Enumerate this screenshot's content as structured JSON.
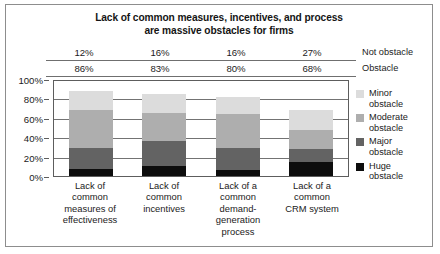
{
  "chart_data": {
    "type": "bar",
    "subtype": "stacked-bar-100",
    "title": "Lack of common measures, incentives, and process are massive obstacles for firms",
    "title_line1": "Lack of common measures, incentives, and process",
    "title_line2": "are massive obstacles for firms",
    "xlabel": "",
    "ylabel": "",
    "ylim": [
      0,
      100
    ],
    "ytick_labels": [
      "100%",
      "80%",
      "60%",
      "40%",
      "20%",
      "0%"
    ],
    "ytick_values": [
      100,
      80,
      60,
      40,
      20,
      0
    ],
    "grid": true,
    "legend_position": "right",
    "categories": [
      "Lack of common measures of effectiveness",
      "Lack of common incentives",
      "Lack of a common demand-generation process",
      "Lack of a common CRM system"
    ],
    "category_lines": [
      [
        "Lack of",
        "common",
        "measures of",
        "effectiveness"
      ],
      [
        "Lack of",
        "common",
        "incentives"
      ],
      [
        "Lack of a",
        "common",
        "demand-",
        "generation",
        "process"
      ],
      [
        "Lack of a",
        "common",
        "CRM system"
      ]
    ],
    "series": [
      {
        "name": "Huge obstacle",
        "color": "#0d0d0d",
        "values": [
          7,
          10,
          6,
          14
        ]
      },
      {
        "name": "Major obstacle",
        "color": "#636363",
        "values": [
          22,
          26,
          23,
          14
        ]
      },
      {
        "name": "Moderate obstacle",
        "color": "#aeaeae",
        "values": [
          39,
          29,
          35,
          19
        ]
      },
      {
        "name": "Minor obstacle",
        "color": "#dcdcdc",
        "values": [
          20,
          20,
          17,
          21
        ]
      }
    ],
    "bar_totals": [
      88,
      85,
      81,
      68
    ],
    "annotations": {
      "row_labels": [
        "Not obstacle",
        "Obstacle"
      ],
      "not_obstacle": [
        "12%",
        "16%",
        "16%",
        "27%"
      ],
      "obstacle": [
        "86%",
        "83%",
        "80%",
        "68%"
      ]
    }
  },
  "legend": {
    "items": [
      {
        "label_line1": "Minor",
        "label_line2": "obstacle",
        "color": "#dcdcdc"
      },
      {
        "label_line1": "Moderate",
        "label_line2": "obstacle",
        "color": "#aeaeae"
      },
      {
        "label_line1": "Major",
        "label_line2": "obstacle",
        "color": "#636363"
      },
      {
        "label_line1": "Huge",
        "label_line2": "obstacle",
        "color": "#0d0d0d"
      }
    ]
  }
}
